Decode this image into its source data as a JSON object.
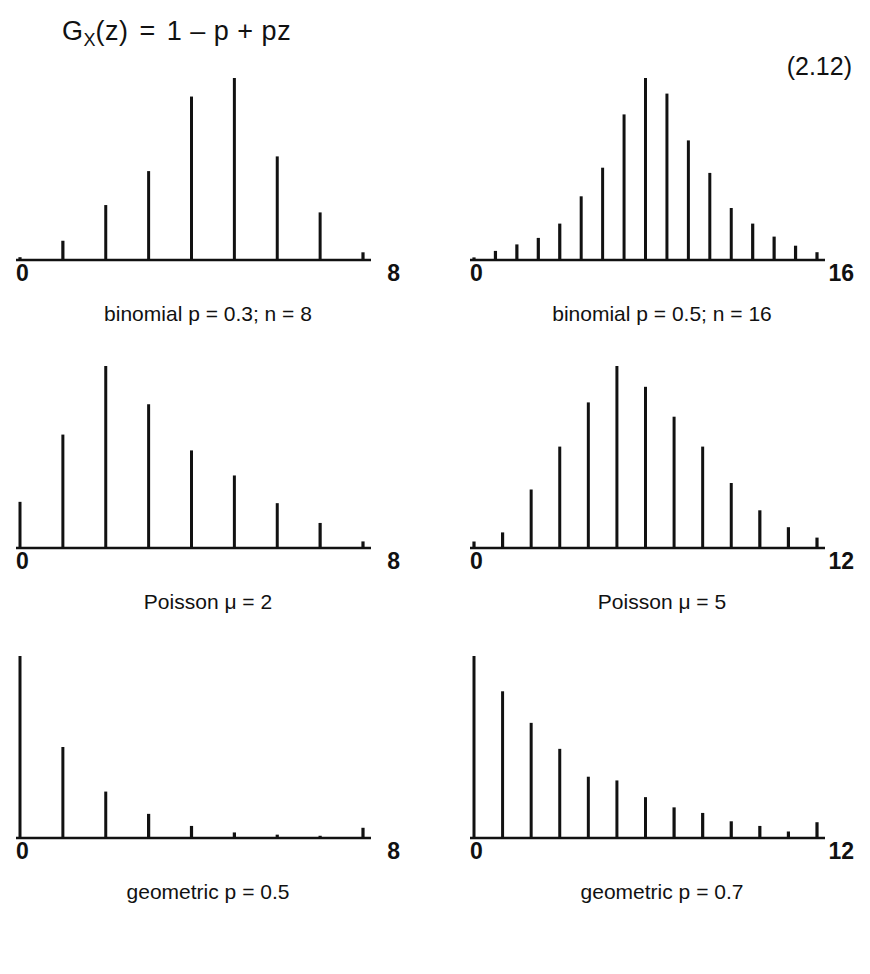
{
  "equation": {
    "lhs": "G",
    "lhs_sub": "X",
    "lhs_arg": "(z)",
    "equals": "=",
    "rhs": "1 – p + pz",
    "full_text": "G_X(z)  =  1 – p + pz",
    "number": "(2.12)"
  },
  "chart_data": [
    {
      "id": "binomial-p03-n8",
      "type": "bar",
      "title": "binomial p = 0.3; n = 8",
      "xlabel": "",
      "ylabel": "",
      "axis_left_label": "0",
      "axis_right_label": "8",
      "xlim": [
        0,
        8
      ],
      "grid": false,
      "legend": "none",
      "categories": [
        0,
        1,
        2,
        3,
        4,
        5,
        6,
        7,
        8
      ],
      "values": [
        0.008,
        0.055,
        0.157,
        0.254,
        0.467,
        0.52,
        0.296,
        0.136,
        0.022
      ]
    },
    {
      "id": "binomial-p05-n16",
      "type": "bar",
      "title": "binomial p = 0.5; n = 16",
      "xlabel": "",
      "ylabel": "",
      "axis_left_label": "0",
      "axis_right_label": "16",
      "xlim": [
        0,
        16
      ],
      "grid": false,
      "legend": "none",
      "categories": [
        0,
        1,
        2,
        3,
        4,
        5,
        6,
        7,
        8,
        9,
        10,
        11,
        12,
        13,
        14,
        15,
        16
      ],
      "values": [
        0.01,
        0.035,
        0.06,
        0.085,
        0.14,
        0.245,
        0.355,
        0.56,
        0.7,
        0.64,
        0.46,
        0.335,
        0.2,
        0.14,
        0.09,
        0.055,
        0.03
      ]
    },
    {
      "id": "poisson-mu2",
      "type": "bar",
      "title": "Poisson μ = 2",
      "xlabel": "",
      "ylabel": "",
      "axis_left_label": "0",
      "axis_right_label": "8",
      "xlim": [
        0,
        8
      ],
      "grid": false,
      "legend": "none",
      "categories": [
        0,
        1,
        2,
        3,
        4,
        5,
        6,
        7,
        8
      ],
      "values": [
        0.175,
        0.43,
        0.69,
        0.545,
        0.37,
        0.275,
        0.17,
        0.095,
        0.025
      ]
    },
    {
      "id": "poisson-mu5",
      "type": "bar",
      "title": "Poisson μ = 5",
      "xlabel": "",
      "ylabel": "",
      "axis_left_label": "0",
      "axis_right_label": "12",
      "xlim": [
        0,
        12
      ],
      "grid": false,
      "legend": "none",
      "categories": [
        0,
        1,
        2,
        3,
        4,
        5,
        6,
        7,
        8,
        9,
        10,
        11,
        12
      ],
      "values": [
        0.025,
        0.06,
        0.225,
        0.39,
        0.56,
        0.7,
        0.62,
        0.505,
        0.39,
        0.25,
        0.145,
        0.08,
        0.04
      ]
    },
    {
      "id": "geometric-p05",
      "type": "bar",
      "title": "geometric p = 0.5",
      "xlabel": "",
      "ylabel": "",
      "axis_left_label": "0",
      "axis_right_label": "8",
      "xlim": [
        0,
        8
      ],
      "grid": false,
      "legend": "none",
      "categories": [
        0,
        1,
        2,
        3,
        4,
        5,
        6,
        7,
        8
      ],
      "values": [
        0.98,
        0.49,
        0.25,
        0.13,
        0.065,
        0.03,
        0.018,
        0.012,
        0.055
      ]
    },
    {
      "id": "geometric-p07",
      "type": "bar",
      "title": "geometric p = 0.7",
      "xlabel": "",
      "ylabel": "",
      "axis_left_label": "0",
      "axis_right_label": "12",
      "xlim": [
        0,
        12
      ],
      "grid": false,
      "legend": "none",
      "categories": [
        0,
        1,
        2,
        3,
        4,
        5,
        6,
        7,
        8,
        9,
        10,
        11,
        12
      ],
      "values": [
        0.98,
        0.79,
        0.62,
        0.48,
        0.33,
        0.31,
        0.22,
        0.165,
        0.135,
        0.09,
        0.065,
        0.035,
        0.085
      ]
    }
  ],
  "style": {
    "ink_color": "#111111",
    "background_color": "#ffffff"
  }
}
